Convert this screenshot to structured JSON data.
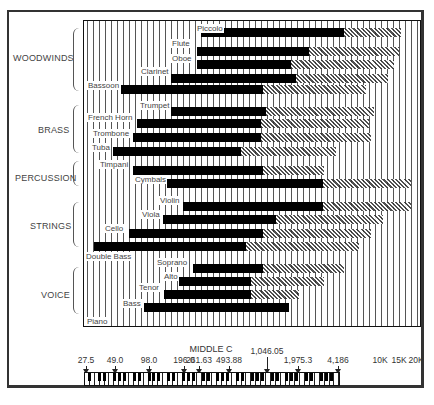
{
  "chart_data": {
    "type": "bar",
    "subtype": "horizontal range bar (frequency range)",
    "title": "",
    "xlabel": "Frequency (Hz), log scale with piano keyboard reference",
    "x_scale": "log",
    "xlim": [
      27.5,
      20000
    ],
    "x_tick_labels": [
      "27.5",
      "49.0",
      "98.0",
      "196.0",
      "261.63",
      "493.88",
      "1,046.05",
      "1,975.3",
      "4,186",
      "10K",
      "15K",
      "20K"
    ],
    "x_tick_values": [
      27.5,
      49.0,
      98.0,
      196.0,
      261.63,
      493.88,
      1046.05,
      1975.3,
      4186,
      10000,
      15000,
      20000
    ],
    "annotation": "MIDDLE C",
    "annotation_at": 261.63,
    "legend": [
      {
        "name": "Fundamental range",
        "style": "solid black"
      },
      {
        "name": "Harmonics / overtones",
        "style": "cross-hatched"
      }
    ],
    "groups": [
      "WOODWINDS",
      "BRASS",
      "PERCUSSION",
      "STRINGS",
      "VOICE"
    ],
    "series": [
      {
        "name": "Piccolo",
        "group": "WOODWINDS",
        "fundamental": [
          600,
          3500
        ],
        "harmonics_to": 10000
      },
      {
        "name": "Flute",
        "group": "WOODWINDS",
        "fundamental": [
          550,
          2200
        ],
        "harmonics_to": 10000
      },
      {
        "name": "Oboe",
        "group": "WOODWINDS",
        "fundamental": [
          550,
          1550
        ],
        "harmonics_to": 9000
      },
      {
        "name": "Clarinet",
        "group": "WOODWINDS",
        "fundamental": [
          330,
          1800
        ],
        "harmonics_to": 8000
      },
      {
        "name": "Bassoon",
        "group": "WOODWINDS",
        "fundamental": [
          100,
          1000
        ],
        "harmonics_to": 5000
      },
      {
        "name": "Trumpet",
        "group": "BRASS",
        "fundamental": [
          330,
          1050
        ],
        "harmonics_to": 6000
      },
      {
        "name": "French Horn",
        "group": "BRASS",
        "fundamental": [
          150,
          1000
        ],
        "harmonics_to": 5500
      },
      {
        "name": "Trombone",
        "group": "BRASS",
        "fundamental": [
          140,
          1000
        ],
        "harmonics_to": 5700
      },
      {
        "name": "Tuba",
        "group": "BRASS",
        "fundamental": [
          75,
          600
        ],
        "harmonics_to": 3700
      },
      {
        "name": "Timpani",
        "group": "PERCUSSION",
        "fundamental": [
          90,
          1000
        ],
        "harmonics_to": 3500
      },
      {
        "name": "Cymbals",
        "group": "PERCUSSION",
        "fundamental": [
          300,
          3500
        ],
        "harmonics_to": 17000
      },
      {
        "name": "Violin",
        "group": "STRINGS",
        "fundamental": [
          400,
          3500
        ],
        "harmonics_to": 17000
      },
      {
        "name": "Viola",
        "group": "STRINGS",
        "fundamental": [
          260,
          1550
        ],
        "harmonics_to": 9000
      },
      {
        "name": "Cello",
        "group": "STRINGS",
        "fundamental": [
          120,
          1000
        ],
        "harmonics_to": 5700
      },
      {
        "name": "Double Bass",
        "group": "STRINGS",
        "fundamental": [
          40,
          780
        ],
        "harmonics_to": 4500
      },
      {
        "name": "Soprano",
        "group": "VOICE",
        "fundamental": [
          500,
          1050
        ],
        "harmonics_to": 5000
      },
      {
        "name": "Alto",
        "group": "VOICE",
        "fundamental": [
          380,
          880
        ],
        "harmonics_to": 3500
      },
      {
        "name": "Tenor",
        "group": "VOICE",
        "fundamental": [
          280,
          880
        ],
        "harmonics_to": 2300
      },
      {
        "name": "Bass",
        "group": "VOICE",
        "fundamental": [
          190,
          1900
        ],
        "harmonics_to": 1900
      },
      {
        "name": "Piano",
        "group": "",
        "fundamental": [
          27.5,
          4186
        ],
        "harmonics_to": 15000
      }
    ],
    "grid": "vertical lines (one per piano key)"
  },
  "plot": {
    "bars": [
      {
        "label": "Piccolo",
        "y": 7,
        "x0": 117,
        "x1": 260,
        "x2": 317,
        "lx": 112
      },
      {
        "label": "Flute",
        "y": 26,
        "x0": 113,
        "x1": 225,
        "x2": 315,
        "lx": 87
      },
      {
        "label": "Oboe",
        "y": 39,
        "x0": 113,
        "x1": 207,
        "x2": 310,
        "lx": 87
      },
      {
        "label": "Clarinet",
        "y": 53,
        "x0": 87,
        "x1": 212,
        "x2": 304,
        "lx": 56
      },
      {
        "label": "Bassoon",
        "y": 64,
        "x0": 37,
        "x1": 179,
        "x2": 282,
        "lx": 3
      },
      {
        "label": "Trumpet",
        "y": 86,
        "x0": 87,
        "x1": 182,
        "x2": 290,
        "lx": 55
      },
      {
        "label": "French Horn",
        "y": 98,
        "x0": 53,
        "x1": 177,
        "x2": 285,
        "lx": 3
      },
      {
        "label": "Trombone",
        "y": 112,
        "x0": 49,
        "x1": 177,
        "x2": 287,
        "lx": 8
      },
      {
        "label": "Tuba",
        "y": 126,
        "x0": 29,
        "x1": 157,
        "x2": 252,
        "lx": 7
      },
      {
        "label": "Timpani",
        "y": 145,
        "x0": 49,
        "x1": 179,
        "x2": 240,
        "lx": 15
      },
      {
        "label": "Cymbals",
        "y": 158,
        "x0": 83,
        "x1": 239,
        "x2": 327,
        "lx": 50
      },
      {
        "label": "Violin",
        "y": 181,
        "x0": 99,
        "x1": 239,
        "x2": 327,
        "lx": 75
      },
      {
        "label": "Viola",
        "y": 194,
        "x0": 79,
        "x1": 192,
        "x2": 299,
        "lx": 57
      },
      {
        "label": "Cello",
        "y": 208,
        "x0": 45,
        "x1": 179,
        "x2": 287,
        "lx": 20
      },
      {
        "label": "Double Bass",
        "y": 221,
        "x0": 10,
        "x1": 162,
        "x2": 275,
        "lx": 1
      },
      {
        "label": "Soprano",
        "y": 243,
        "x0": 109,
        "x1": 179,
        "x2": 260,
        "lx": 72
      },
      {
        "label": "Alto",
        "y": 256,
        "x0": 95,
        "x1": 167,
        "x2": 240,
        "lx": 79
      },
      {
        "label": "Tenor",
        "y": 269,
        "x0": 80,
        "x1": 167,
        "x2": 215,
        "lx": 54
      },
      {
        "label": "Bass",
        "y": 282,
        "x0": 60,
        "x1": 205,
        "x2": 205,
        "lx": 38
      },
      {
        "label": "Piano",
        "y": 305,
        "x0": 2,
        "x1": 257,
        "x2": 323,
        "lx": 2
      }
    ],
    "label_offsets": {
      "Piccolo": -4,
      "Flute": -8,
      "Oboe": -6,
      "Clarinet": -7,
      "Bassoon": -4,
      "Trumpet": -6,
      "French Horn": -6,
      "Trombone": -4,
      "Tuba": -4,
      "Timpani": -6,
      "Cymbals": -4,
      "Violin": -6,
      "Viola": -5,
      "Cello": -5,
      "Double Bass": 10,
      "Soprano": -6,
      "Alto": -5,
      "Tenor": -7,
      "Bass": -4,
      "Piano": -9
    },
    "groups": [
      {
        "name": "WOODWINDS",
        "tx": 13,
        "ty": 53,
        "by": 28,
        "bh": 63
      },
      {
        "name": "BRASS",
        "tx": 38,
        "ty": 125,
        "by": 105,
        "bh": 48
      },
      {
        "name": "PERCUSSION",
        "tx": 15,
        "ty": 173,
        "by": 161,
        "bh": 25
      },
      {
        "name": "STRINGS",
        "tx": 30,
        "ty": 221,
        "by": 202,
        "bh": 45
      },
      {
        "name": "VOICE",
        "tx": 41,
        "ty": 290,
        "by": 267,
        "bh": 47
      }
    ]
  },
  "axis": {
    "middle_c_label": "MIDDLE C",
    "ticks": [
      {
        "label": "27.5",
        "x": 86,
        "arrow": true
      },
      {
        "label": "49.0",
        "x": 115,
        "arrow": true
      },
      {
        "label": "98.0",
        "x": 149,
        "arrow": true
      },
      {
        "label": "196.0",
        "x": 184,
        "arrow": true
      },
      {
        "label": "261.63",
        "x": 199,
        "arrow": true
      },
      {
        "label": "493.88",
        "x": 229,
        "arrow": true
      },
      {
        "label": "1,046.05",
        "x": 267,
        "arrow": true
      },
      {
        "label": "1,975.3",
        "x": 298,
        "arrow": true
      },
      {
        "label": "4,186",
        "x": 338,
        "arrow": true
      },
      {
        "label": "10K",
        "x": 380,
        "arrow": false
      },
      {
        "label": "15K",
        "x": 399,
        "arrow": false
      },
      {
        "label": "20K",
        "x": 416,
        "arrow": false
      }
    ]
  }
}
